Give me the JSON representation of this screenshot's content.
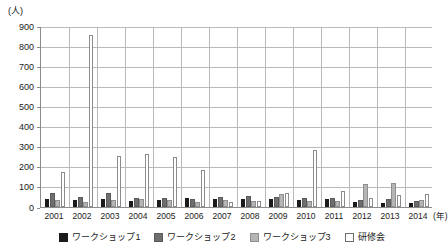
{
  "chart_data": {
    "type": "bar",
    "title": "",
    "subtitle": "",
    "unit_label": "(人)",
    "xlabel": "(年)",
    "ylabel": "",
    "ylim": [
      0,
      900
    ],
    "ytick_step": 100,
    "yticks": [
      "900",
      "800",
      "700",
      "600",
      "500",
      "400",
      "300",
      "200",
      "100",
      "0"
    ],
    "grid": true,
    "legend_position": "bottom",
    "categories": [
      "2001",
      "2002",
      "2003",
      "2004",
      "2005",
      "2006",
      "2007",
      "2008",
      "2009",
      "2010",
      "2011",
      "2012",
      "2013",
      "2014"
    ],
    "series": [
      {
        "name": "ワークショップ1",
        "color": "#1b1b1b",
        "values": [
          42,
          36,
          42,
          31,
          37,
          44,
          40,
          42,
          40,
          37,
          40,
          26,
          22,
          18
        ]
      },
      {
        "name": "ワークショップ2",
        "color": "#6e6e6e",
        "values": [
          68,
          48,
          70,
          46,
          44,
          40,
          52,
          55,
          48,
          44,
          46,
          34,
          40,
          32
        ]
      },
      {
        "name": "ワークショップ3",
        "color": "#b5b5b5",
        "values": [
          34,
          27,
          35,
          38,
          36,
          26,
          34,
          30,
          64,
          32,
          30,
          115,
          118,
          36
        ]
      },
      {
        "name": "研修会",
        "color": "#ffffff",
        "values": [
          175,
          855,
          256,
          266,
          250,
          186,
          25,
          28,
          72,
          285,
          80,
          46,
          58,
          66
        ]
      }
    ]
  },
  "legend": {
    "items": [
      {
        "label": "ワークショップ1",
        "swatch": "black-square-icon"
      },
      {
        "label": "ワークショップ2",
        "swatch": "dark-gray-square-icon"
      },
      {
        "label": "ワークショップ3",
        "swatch": "light-gray-square-icon"
      },
      {
        "label": "研修会",
        "swatch": "white-square-icon"
      }
    ]
  }
}
